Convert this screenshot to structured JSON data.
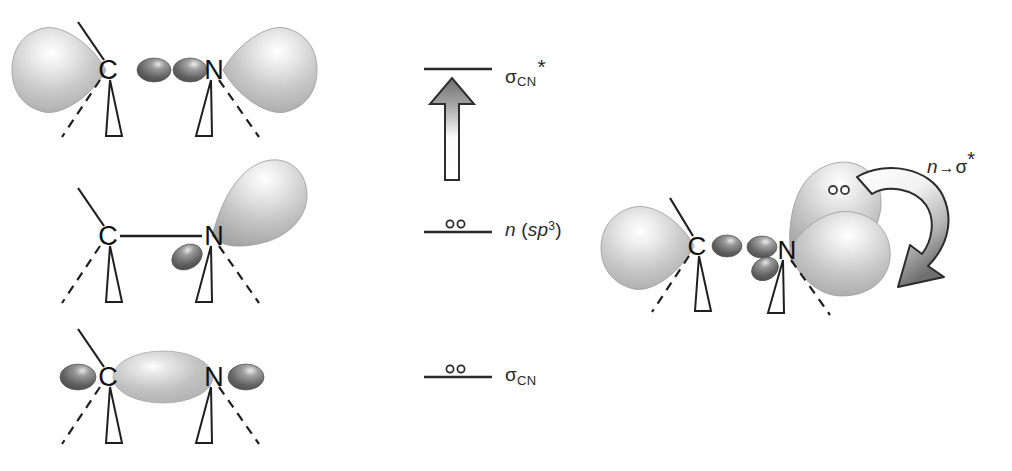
{
  "figure": {
    "background_color": "#fefefe",
    "ink_color": "#2a2a2a"
  },
  "palette": {
    "lobe_light": "#f2f2f2",
    "lobe_mid": "#b8b8b8",
    "lobe_dark": "#8d8d8d",
    "small_lobe_dark": "#6e6e6e",
    "small_lobe_darker": "#4a4a4a",
    "bond_line": "#222222",
    "arrow_dark": "#6b6b6b",
    "arrow_light": "#ffffff",
    "outline": "#1a1a1a"
  },
  "left_column": {
    "structures": [
      {
        "id": "sigma-star-orbital",
        "name": "sigma-CN-antibonding-orbital",
        "caption": "sigma*CN antibonding orbital of the C-N bond",
        "atoms": [
          {
            "symbol": "C",
            "x": 108,
            "y": 70
          },
          {
            "symbol": "N",
            "x": 213,
            "y": 70
          }
        ],
        "lobes": [
          {
            "kind": "large-outer-lobe",
            "side": "left",
            "shade": "light"
          },
          {
            "kind": "large-outer-lobe",
            "side": "right",
            "shade": "light"
          },
          {
            "kind": "small-inner-lobe",
            "side": "left-of-bond",
            "shade": "dark"
          },
          {
            "kind": "small-inner-lobe",
            "side": "right-of-bond",
            "shade": "dark"
          }
        ]
      },
      {
        "id": "n-sp3-orbital",
        "name": "nitrogen-lone-pair-sp3-orbital",
        "caption": "n (sp3) lone pair orbital on nitrogen",
        "atoms": [
          {
            "symbol": "C",
            "x": 108,
            "y": 237
          },
          {
            "symbol": "N",
            "x": 213,
            "y": 237
          }
        ],
        "lobes": [
          {
            "kind": "large-teardrop-lobe",
            "side": "upper-right-of-N",
            "shade": "light"
          },
          {
            "kind": "small-lobe",
            "side": "below-left-of-N",
            "shade": "dark"
          }
        ]
      },
      {
        "id": "sigma-orbital",
        "name": "sigma-CN-bonding-orbital",
        "caption": "sigma CN bonding orbital of the C-N bond",
        "atoms": [
          {
            "symbol": "C",
            "x": 108,
            "y": 377
          },
          {
            "symbol": "N",
            "x": 213,
            "y": 377
          }
        ],
        "lobes": [
          {
            "kind": "large-bonding-lens",
            "side": "between-C-and-N",
            "shade": "light"
          },
          {
            "kind": "small-outer-lobe",
            "side": "left-of-C",
            "shade": "dark"
          },
          {
            "kind": "small-outer-lobe",
            "side": "right-of-N",
            "shade": "dark"
          }
        ]
      }
    ],
    "atom_labels": {
      "carbon": "C",
      "nitrogen": "N"
    }
  },
  "energy_diagram": {
    "name": "molecular-orbital-energy-level-diagram",
    "levels": [
      {
        "id": "level-sigma-star",
        "name": "energy-level-sigma-star-cn",
        "symbol": "σ",
        "subscript": "CN",
        "superscript": "*",
        "electrons": 0,
        "electron_glyph": "",
        "line_y": 69,
        "label_text": "σCN*"
      },
      {
        "id": "level-n-sp3",
        "name": "energy-level-n-sp3",
        "symbol": "n",
        "subscript": "",
        "parenthetical": "(sp3)",
        "electrons": 2,
        "electron_glyph": "∘∘",
        "line_y": 232,
        "label_text": "n (sp3)"
      },
      {
        "id": "level-sigma",
        "name": "energy-level-sigma-cn",
        "symbol": "σ",
        "subscript": "CN",
        "superscript": "",
        "electrons": 2,
        "electron_glyph": "∘∘",
        "line_y": 377,
        "label_text": "σCN"
      }
    ],
    "energy_arrow": {
      "name": "energy-increase-arrow",
      "direction": "up",
      "meaning": "increasing energy",
      "gradient_from": "#ffffff",
      "gradient_to": "#6b6b6b"
    }
  },
  "right_panel": {
    "name": "overlap-structure",
    "caption": "Antiperiplanar overlap of the nitrogen lone pair with the C-N sigma* orbital",
    "atoms": [
      {
        "symbol": "C",
        "x": 697,
        "y": 246
      },
      {
        "symbol": "N",
        "x": 785,
        "y": 250
      }
    ],
    "lone_pair_dots": "∘∘",
    "interaction_label": {
      "name": "n-to-sigma-star-label",
      "n": "n",
      "arrow": "→",
      "sigma": "σ",
      "star": "*",
      "full_text": "n→σ*"
    },
    "curved_arrow": {
      "name": "electron-donation-curved-arrow",
      "style": "hollow ribbon with gray gradient",
      "direction": "clockwise, from lone pair down into sigma* lobe"
    }
  }
}
